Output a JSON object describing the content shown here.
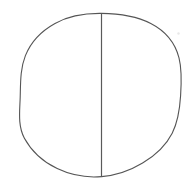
{
  "canvas": {
    "width": 193,
    "height": 186,
    "background_color": "#ffffff",
    "description": "Hand-drawn style circle divided by a single vertical line"
  },
  "figure": {
    "stroke_color": "#555555",
    "chord_color": "#5a5a5a",
    "fill_color": "none",
    "stroke_width": 1,
    "shapes": [
      {
        "name": "circle-outline",
        "type": "ellipse",
        "center_x": 100.5,
        "center_y": 95,
        "radius_x": 80.5,
        "radius_y": 82,
        "left": 20,
        "right": 181,
        "top": 13,
        "bottom": 177,
        "stroke": "#555555",
        "fill": "none",
        "stroke_width": 1.1
      },
      {
        "name": "vertical-divider-line",
        "type": "line",
        "x1": 101.5,
        "y1": 13.5,
        "x2": 101.5,
        "y2": 176.5,
        "stroke": "#5a5a5a",
        "stroke_width": 1.2
      },
      {
        "name": "stray-speck",
        "type": "dot",
        "cx": 178.5,
        "cy": 33.5,
        "r": 1.2,
        "fill": "#e8e8e8"
      }
    ]
  }
}
